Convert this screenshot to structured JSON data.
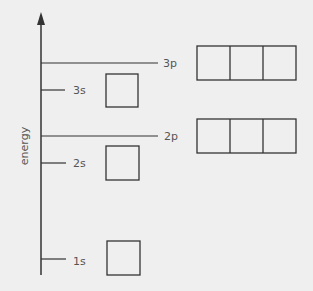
{
  "diagram": {
    "axis_label": "energy",
    "colors": {
      "background": "#efefef",
      "line": "#333333",
      "text": "#555555"
    },
    "levels": [
      {
        "name": "1s",
        "label": "1s",
        "type": "s",
        "y": 259,
        "boxes": 1
      },
      {
        "name": "2s",
        "label": "2s",
        "type": "s",
        "y": 163,
        "boxes": 1
      },
      {
        "name": "2p",
        "label": "2p",
        "type": "p",
        "y": 136,
        "boxes": 3
      },
      {
        "name": "3s",
        "label": "3s",
        "type": "s",
        "y": 90,
        "boxes": 1
      },
      {
        "name": "3p",
        "label": "3p",
        "type": "p",
        "y": 63,
        "boxes": 3
      }
    ]
  }
}
